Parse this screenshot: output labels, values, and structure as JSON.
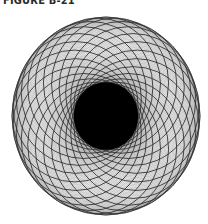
{
  "figure": {
    "label": "FIGURE B-21",
    "center": [
      106,
      116
    ],
    "outer_radius_x": 94,
    "outer_radius_y": 99,
    "inner_disc_radius": 32,
    "fine_circle_count": 144,
    "bold_circle_count": 24,
    "colors": {
      "background": "#ffffff",
      "fine_line": "#8c8c8c",
      "bold_line": "#2b2b2b",
      "inner_disc": "#000000",
      "label": "#2a2a2a"
    }
  }
}
